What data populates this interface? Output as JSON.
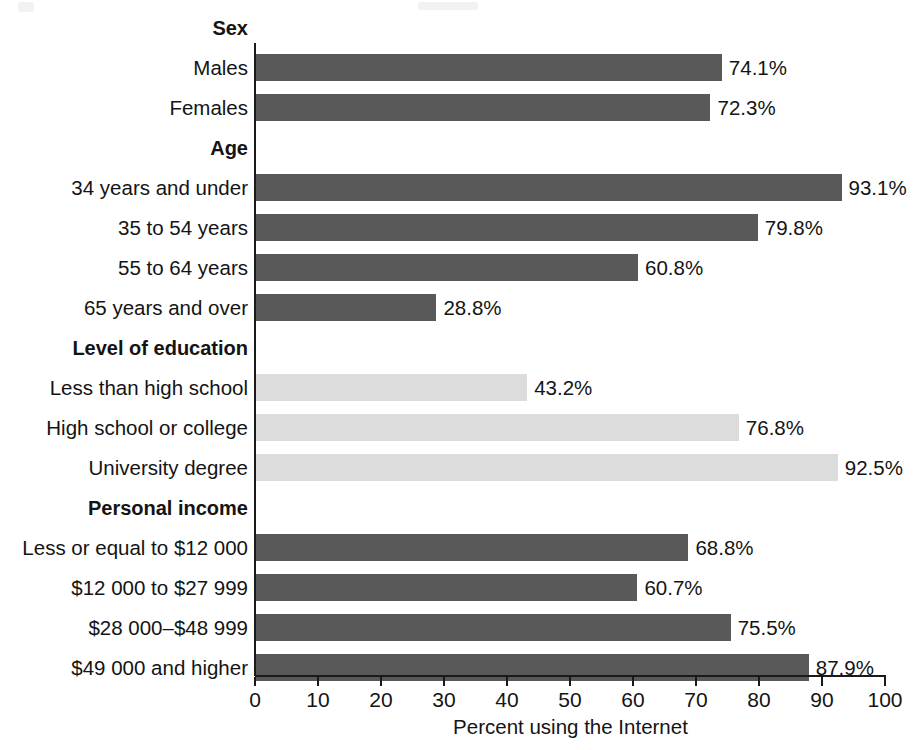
{
  "chart_data": {
    "type": "bar",
    "orientation": "horizontal",
    "title": "",
    "xlabel": "Percent using the Internet",
    "ylabel": "",
    "xlim": [
      0,
      100
    ],
    "xticks": [
      0,
      10,
      20,
      30,
      40,
      50,
      60,
      70,
      80,
      90,
      100
    ],
    "xtick_labels": [
      "0",
      "10",
      "20",
      "30",
      "40",
      "50",
      "60",
      "70",
      "80",
      "90",
      "100"
    ],
    "grid": false,
    "legend": "none",
    "value_label_suffix": "%",
    "colors": {
      "dark_bar": "#595959",
      "light_bar": "#dcdcdc",
      "axis": "#1a1a1a",
      "text": "#141414",
      "background": "#ffffff"
    },
    "groups": [
      {
        "heading": "Sex",
        "bar_color": "dark",
        "categories": [
          "Males",
          "Females"
        ],
        "values": [
          74.1,
          72.3
        ],
        "value_labels": [
          "74.1%",
          "72.3%"
        ]
      },
      {
        "heading": "Age",
        "bar_color": "dark",
        "categories": [
          "34 years and under",
          "35 to 54 years",
          "55 to 64 years",
          "65 years and over"
        ],
        "values": [
          93.1,
          79.8,
          60.8,
          28.8
        ],
        "value_labels": [
          "93.1%",
          "79.8%",
          "60.8%",
          "28.8%"
        ]
      },
      {
        "heading": "Level of education",
        "bar_color": "light",
        "categories": [
          "Less than high school",
          "High school or college",
          "University degree"
        ],
        "values": [
          43.2,
          76.8,
          92.5
        ],
        "value_labels": [
          "43.2%",
          "76.8%",
          "92.5%"
        ]
      },
      {
        "heading": "Personal income",
        "bar_color": "dark",
        "categories": [
          "Less or equal to $12 000",
          "$12 000 to $27 999",
          "$28 000–$48 999",
          "$49 000 and higher"
        ],
        "values": [
          68.8,
          60.7,
          75.5,
          87.9
        ],
        "value_labels": [
          "68.8%",
          "60.7%",
          "75.5%",
          "87.9%"
        ]
      }
    ]
  }
}
